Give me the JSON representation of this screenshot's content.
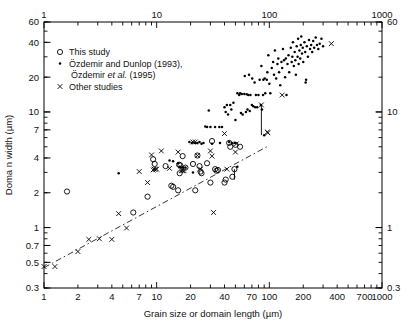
{
  "figure": {
    "background_color": "#ffffff",
    "frame_color": "#000000",
    "marker_color": "#000000"
  },
  "axes": {
    "x_bottom_title": "Grain size or domain length (µm)",
    "y_left_title": "Doma n width (µm)",
    "x_bottom_ticks": [
      "1",
      "2",
      "4",
      "7",
      "10",
      "20",
      "40",
      "70",
      "100",
      "200",
      "400",
      "700",
      "1000"
    ],
    "x_top_ticks": [
      "1",
      "10",
      "100",
      "1000"
    ],
    "y_left_ticks": [
      "60",
      "40",
      "20",
      "10",
      "7",
      "4",
      "2",
      "1",
      "0.7",
      "0.5",
      "0.3"
    ],
    "y_right_ticks": [
      "60",
      "10",
      "1",
      "0.3"
    ]
  },
  "legend": {
    "entries": [
      {
        "marker": "open-circle",
        "label": "This study"
      },
      {
        "marker": "filled-dot",
        "label": "Özdemir and Dunlop (1993),",
        "label2_pre": "Özdemir ",
        "label2_it": "et al.",
        "label2_post": " (1995)"
      },
      {
        "marker": "cross-x",
        "label": "Other studies"
      }
    ]
  },
  "chart_data": {
    "type": "scatter",
    "title": "",
    "xlabel": "Grain size or domain length (µm)",
    "ylabel": "Doma n width (µm)",
    "xscale": "log",
    "yscale": "log",
    "xlim": [
      1,
      1000
    ],
    "ylim": [
      0.3,
      60
    ],
    "grid": false,
    "legend_position": "upper-left",
    "series": [
      {
        "name": "This study",
        "marker": "open-circle",
        "points": [
          [
            6.2,
            1.35
          ],
          [
            8.3,
            1.85
          ],
          [
            9.3,
            3.9
          ],
          [
            9.6,
            3.55
          ],
          [
            13.5,
            2.3
          ],
          [
            14.0,
            2.25
          ],
          [
            15.5,
            2.1
          ],
          [
            15.8,
            3.5
          ],
          [
            16.0,
            2.95
          ],
          [
            16.2,
            3.45
          ],
          [
            17.0,
            4.15
          ],
          [
            18.0,
            3.3
          ],
          [
            21.0,
            3.55
          ],
          [
            22.0,
            2.1
          ],
          [
            23.0,
            4.2
          ],
          [
            24.0,
            3.4
          ],
          [
            24.5,
            3.05
          ],
          [
            25.0,
            2.95
          ],
          [
            28.0,
            3.6
          ],
          [
            30.0,
            2.45
          ],
          [
            31.0,
            5.6
          ],
          [
            33.0,
            3.2
          ],
          [
            34.0,
            3.1
          ],
          [
            35.0,
            3.15
          ],
          [
            40.0,
            2.45
          ],
          [
            41.0,
            2.6
          ],
          [
            44.0,
            5.4
          ],
          [
            45.0,
            5.0
          ],
          [
            47.0,
            2.75
          ],
          [
            49.0,
            3.2
          ],
          [
            50.0,
            5.2
          ],
          [
            55.0,
            5.0
          ],
          [
            1.6,
            2.05
          ],
          [
            12.0,
            3.4
          ]
        ]
      },
      {
        "name": "Özdemir and Dunlop (1993), Özdemir et al. (1995)",
        "marker": "filled-dot",
        "points": [
          [
            4.6,
            2.95
          ],
          [
            13.0,
            3.8
          ],
          [
            14.0,
            3.75
          ],
          [
            15.5,
            3.6
          ],
          [
            16.0,
            3.35
          ],
          [
            16.5,
            3.3
          ],
          [
            17.2,
            3.3
          ],
          [
            18.0,
            3.3
          ],
          [
            19.5,
            5.5
          ],
          [
            20.5,
            5.4
          ],
          [
            21.0,
            3.0
          ],
          [
            22.0,
            5.4
          ],
          [
            23.0,
            5.4
          ],
          [
            25.0,
            5.3
          ],
          [
            27.0,
            7.5
          ],
          [
            28.0,
            7.4
          ],
          [
            29.0,
            10.3
          ],
          [
            30.0,
            7.4
          ],
          [
            31.0,
            5.3
          ],
          [
            33.0,
            7.4
          ],
          [
            36.0,
            7.4
          ],
          [
            38.0,
            7.4
          ],
          [
            40.0,
            11.0
          ],
          [
            41.0,
            10.0
          ],
          [
            42.0,
            11.5
          ],
          [
            43.0,
            9.5
          ],
          [
            45.0,
            11.5
          ],
          [
            46.0,
            10.5
          ],
          [
            48.0,
            12.0
          ],
          [
            50.0,
            8.5
          ],
          [
            52.0,
            14.5
          ],
          [
            54.0,
            14.0
          ],
          [
            55.0,
            14.5
          ],
          [
            57.0,
            14.3
          ],
          [
            58.0,
            9.5
          ],
          [
            60.0,
            14.3
          ],
          [
            62.0,
            10.0
          ],
          [
            63.0,
            14.2
          ],
          [
            65.0,
            14.0
          ],
          [
            66.0,
            21.0
          ],
          [
            68.0,
            14.0
          ],
          [
            70.0,
            11.5
          ],
          [
            70.5,
            19.5
          ],
          [
            72.0,
            11.2
          ],
          [
            74.0,
            18.0
          ],
          [
            75.0,
            11.0
          ],
          [
            76.0,
            14.0
          ],
          [
            78.0,
            11.0
          ],
          [
            80.0,
            14.0
          ],
          [
            82.0,
            19.0
          ],
          [
            84.0,
            11.5
          ],
          [
            85.0,
            25.0
          ],
          [
            88.0,
            14.0
          ],
          [
            90.0,
            6.3
          ],
          [
            92.0,
            14.5
          ],
          [
            95.0,
            19.0
          ],
          [
            96.0,
            22.0
          ],
          [
            98.0,
            31.0
          ],
          [
            100.0,
            17.5
          ],
          [
            102.0,
            14.5
          ],
          [
            105.0,
            24.0
          ],
          [
            108.0,
            27.0
          ],
          [
            110.0,
            21.0
          ],
          [
            112.0,
            34.0
          ],
          [
            115.0,
            19.5
          ],
          [
            118.0,
            26.0
          ],
          [
            120.0,
            29.0
          ],
          [
            122.0,
            22.0
          ],
          [
            125.0,
            17.0
          ],
          [
            128.0,
            27.0
          ],
          [
            130.0,
            24.0
          ],
          [
            132.0,
            35.0
          ],
          [
            135.0,
            28.0
          ],
          [
            138.0,
            20.0
          ],
          [
            140.0,
            29.0
          ],
          [
            142.0,
            14.0
          ],
          [
            145.0,
            26.0
          ],
          [
            148.0,
            31.0
          ],
          [
            150.0,
            22.0
          ],
          [
            155.0,
            36.0
          ],
          [
            158.0,
            27.0
          ],
          [
            160.0,
            30.0
          ],
          [
            162.0,
            40.0
          ],
          [
            165.0,
            25.0
          ],
          [
            168.0,
            33.0
          ],
          [
            170.0,
            28.0
          ],
          [
            172.0,
            21.0
          ],
          [
            175.0,
            37.0
          ],
          [
            178.0,
            30.0
          ],
          [
            180.0,
            43.0
          ],
          [
            182.0,
            26.0
          ],
          [
            185.0,
            34.0
          ],
          [
            188.0,
            29.0
          ],
          [
            190.0,
            38.0
          ],
          [
            192.0,
            45.0
          ],
          [
            195.0,
            32.0
          ],
          [
            198.0,
            36.0
          ],
          [
            200.0,
            27.0
          ],
          [
            205.0,
            40.0
          ],
          [
            208.0,
            33.0
          ],
          [
            210.0,
            18.0
          ],
          [
            212.0,
            19.0
          ],
          [
            215.0,
            37.0
          ],
          [
            220.0,
            30.0
          ],
          [
            225.0,
            42.0
          ],
          [
            230.0,
            35.0
          ],
          [
            235.0,
            38.0
          ],
          [
            240.0,
            33.0
          ],
          [
            245.0,
            41.0
          ],
          [
            250.0,
            36.0
          ],
          [
            258.0,
            44.0
          ],
          [
            265.0,
            38.0
          ],
          [
            272.0,
            35.0
          ],
          [
            280.0,
            39.0
          ],
          [
            290.0,
            43.0
          ],
          [
            300.0,
            37.0
          ],
          [
            86.0,
            10.5
          ],
          [
            88.5,
            19.0
          ],
          [
            91.0,
            19.5
          ],
          [
            60.5,
            20.5
          ],
          [
            64.0,
            10.5
          ],
          [
            67.0,
            10.2
          ],
          [
            56.0,
            9.8
          ],
          [
            44.0,
            5.5
          ],
          [
            46.5,
            5.4
          ],
          [
            49.5,
            5.4
          ],
          [
            52.0,
            3.35
          ],
          [
            36.5,
            5.4
          ],
          [
            24.0,
            5.5
          ],
          [
            26.0,
            5.4
          ]
        ]
      },
      {
        "name": "Other studies",
        "marker": "cross-x",
        "points": [
          [
            1.0,
            0.46
          ],
          [
            1.25,
            0.46
          ],
          [
            2.0,
            0.62
          ],
          [
            2.5,
            0.79
          ],
          [
            3.1,
            0.8
          ],
          [
            4.0,
            0.79
          ],
          [
            4.6,
            1.32
          ],
          [
            5.4,
            0.99
          ],
          [
            7.0,
            3.05
          ],
          [
            8.3,
            2.45
          ],
          [
            9.0,
            4.25
          ],
          [
            9.3,
            3.15
          ],
          [
            9.8,
            3.2
          ],
          [
            11.0,
            4.6
          ],
          [
            13.0,
            3.25
          ],
          [
            15.5,
            4.5
          ],
          [
            16.5,
            3.1
          ],
          [
            17.0,
            3.1
          ],
          [
            17.5,
            3.1
          ],
          [
            21.0,
            5.5
          ],
          [
            22.0,
            5.5
          ],
          [
            23.0,
            4.2
          ],
          [
            24.5,
            3.2
          ],
          [
            30.0,
            4.6
          ],
          [
            31.0,
            4.15
          ],
          [
            32.0,
            1.35
          ],
          [
            40.0,
            6.5
          ],
          [
            42.0,
            3.2
          ],
          [
            50.0,
            4.5
          ],
          [
            51.0,
            5.3
          ],
          [
            85.0,
            11.5
          ],
          [
            96.0,
            6.7
          ],
          [
            97.0,
            6.6
          ],
          [
            130.0,
            14.0
          ],
          [
            355.0,
            39.0
          ],
          [
            9.5,
            3.2
          ],
          [
            10.0,
            3.2
          ]
        ]
      }
    ],
    "trend_line": {
      "style": "dash-dot",
      "x_start": 1.0,
      "y_start": 0.45,
      "x_end": 95.0,
      "y_end": 5.0,
      "description": "dash-dot reference line"
    },
    "arrows": [
      {
        "x": 85.0,
        "y_top": 11.5,
        "y_bottom": 6.3,
        "description": "vertical connector between x marker and dot"
      },
      {
        "x": 49.0,
        "y_top": 3.2,
        "y_bottom": 2.6,
        "description": "vertical connector between open circles"
      }
    ]
  }
}
